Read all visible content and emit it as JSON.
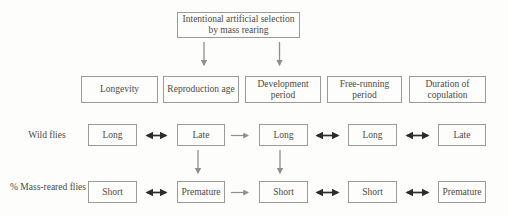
{
  "figure": {
    "top_box": "Intentional artificial selection by mass rearing",
    "headers": [
      "Longevity",
      "Reproduction age",
      "Development period",
      "Free-running period",
      "Duration of copulation"
    ],
    "rows": [
      {
        "label": "Wild flies",
        "cells": [
          "Long",
          "Late",
          "Long",
          "Long",
          "Late"
        ]
      },
      {
        "label": "% Mass-reared flies",
        "cells": [
          "Short",
          "Premature",
          "Short",
          "Short",
          "Premature"
        ]
      }
    ],
    "connectors": {
      "top_box_points_to": [
        "Reproduction age",
        "Development period"
      ],
      "horizontal_arrow_types": [
        "bidirectional-black",
        "forward-gray",
        "bidirectional-black",
        "bidirectional-black"
      ],
      "vertical_arrows": [
        "Late to Premature",
        "Long to Short"
      ]
    }
  },
  "colors": {
    "box_border": "#9a9a9a",
    "text": "#4c4a45",
    "double_arrow": "#2e2c2a",
    "single_arrow": "#8f8f8f",
    "background": "#fdfdfc"
  }
}
